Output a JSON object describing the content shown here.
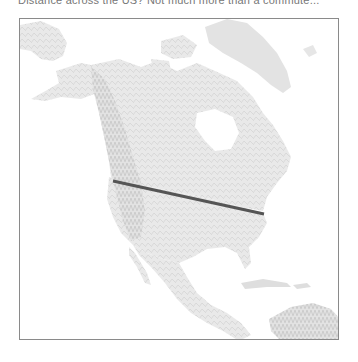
{
  "caption": "Distance across the US? Not much more than a commute...",
  "map": {
    "region": "North America",
    "style": "shaded relief, light gray",
    "frame_color": "#8a8a8a",
    "land_color": "#e6e6e6",
    "relief_color": "#d2d2d2",
    "water_color": "#ffffff"
  },
  "route_line": {
    "color": "#555555",
    "width": 3,
    "start": {
      "x": 112,
      "y": 180
    },
    "end": {
      "x": 263,
      "y": 213
    }
  }
}
